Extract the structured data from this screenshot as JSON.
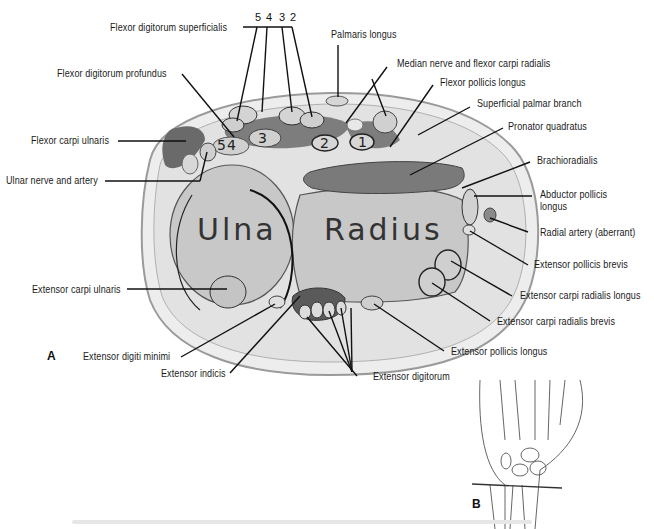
{
  "figure": {
    "panel_a_label": "A",
    "panel_b_label": "B",
    "bones": {
      "ulna": "Ulna",
      "radius": "Radius"
    },
    "fds_tendon_numbers": [
      "5",
      "4",
      "3",
      "2"
    ],
    "fdp_tendon_numbers": [
      "5",
      "4"
    ],
    "compartment_numbers": [
      "1",
      "2",
      "3"
    ],
    "labels": {
      "flexor_digitorum_superficialis": "Flexor digitorum superficialis",
      "palmaris_longus": "Palmaris longus",
      "median_nerve_fcr": "Median nerve and flexor carpi radialis",
      "flexor_pollicis_longus": "Flexor pollicis longus",
      "superficial_palmar_branch": "Superficial palmar branch",
      "pronator_quadratus": "Pronator quadratus",
      "brachioradialis": "Brachioradialis",
      "abductor_pollicis_longus_1": "Abductor pollicis",
      "abductor_pollicis_longus_2": "longus",
      "radial_artery": "Radial artery (aberrant)",
      "extensor_pollicis_brevis": "Extensor pollicis brevis",
      "ecrl": "Extensor carpi radialis longus",
      "ecrb": "Extensor carpi radialis brevis",
      "extensor_pollicis_longus": "Extensor pollicis longus",
      "extensor_digitorum": "Extensor digitorum",
      "extensor_indicis": "Extensor indicis",
      "extensor_digiti_minimi": "Extensor digiti minimi",
      "extensor_carpi_ulnaris": "Extensor carpi ulnaris",
      "ulnar_nerve_artery": "Ulnar nerve and artery",
      "flexor_carpi_ulnaris": "Flexor carpi ulnaris",
      "flexor_digitorum_profundus": "Flexor digitorum profundus"
    },
    "colors": {
      "skin_outline": "#9a9a9a",
      "soft_tissue": "#e4e4e4",
      "bone": "#c9c9c9",
      "muscle_dark": "#6e6e6e",
      "tendon": "#d4d4d4",
      "leader_line": "#111111"
    }
  }
}
